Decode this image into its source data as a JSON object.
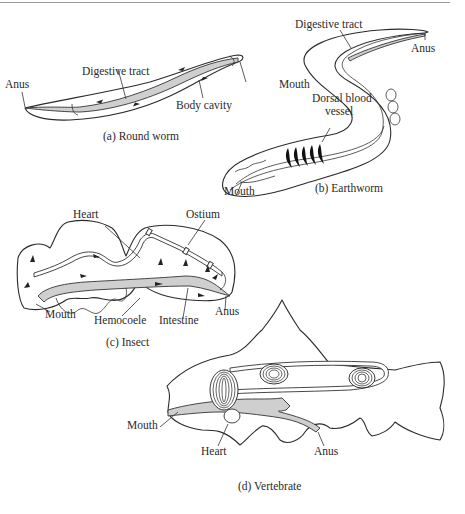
{
  "figure": {
    "panels": [
      {
        "id": "a",
        "caption": "(a)  Round worm",
        "labels": {
          "anus": "Anus",
          "digestive_tract": "Digestive tract",
          "body_cavity": "Body cavity",
          "mouth": "Mouth"
        }
      },
      {
        "id": "b",
        "caption": "(b)  Earthworm",
        "labels": {
          "digestive_tract": "Digestive tract",
          "anus": "Anus",
          "dorsal_blood_vessel_line1": "Dorsal blood",
          "dorsal_blood_vessel_line2": "vessel",
          "mouth": "Mouth"
        }
      },
      {
        "id": "c",
        "caption": "(c) Insect",
        "labels": {
          "heart": "Heart",
          "ostium": "Ostium",
          "mouth": "Mouth",
          "hemocoele": "Hemocoele",
          "intestine": "Intestine",
          "anus": "Anus"
        }
      },
      {
        "id": "d",
        "caption": "(d) Vertebrate",
        "labels": {
          "mouth": "Mouth",
          "heart": "Heart",
          "anus": "Anus"
        }
      }
    ],
    "colors": {
      "line": "#2b2b2b",
      "gut_fill": "#cfcfcf",
      "background": "#ffffff",
      "rule": "#9a9a9a"
    }
  }
}
